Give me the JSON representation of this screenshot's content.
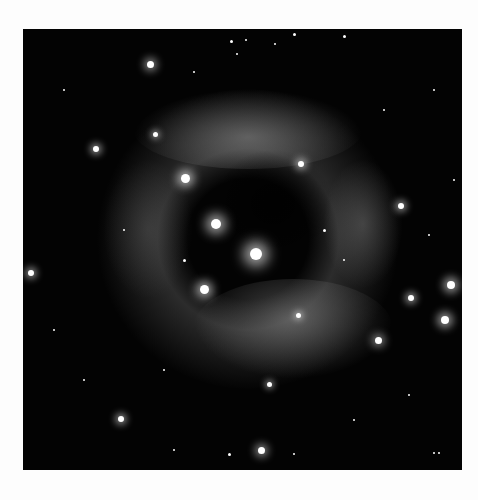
{
  "image": {
    "subject": "star field with glowing ring-shaped nebula (grayscale astronomical photograph)",
    "background_color": "#fdfdfd",
    "sky_color": "#030303"
  }
}
